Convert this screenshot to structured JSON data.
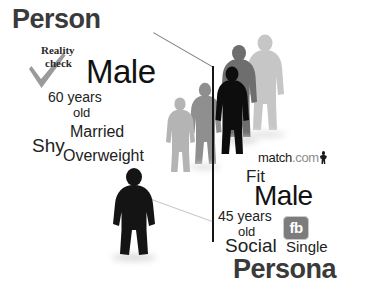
{
  "image": {
    "width": 368,
    "height": 296,
    "background": "#ffffff",
    "kind": "concept-diagram",
    "theme": "person-versus-online-dating-persona"
  },
  "headings": {
    "left": "Person",
    "right": "Persona"
  },
  "person_cloud": {
    "reality_line1": "Reality",
    "reality_line2": "check",
    "primary": "Male",
    "age_line1": "60 years",
    "age_line2": "old",
    "married": "Married",
    "shy": "Shy",
    "overweight": "Overweight"
  },
  "persona_cloud": {
    "brand_primary": "match",
    "brand_suffix": ".com",
    "fit": "Fit",
    "primary": "Male",
    "age_line1": "45 years",
    "age_line2": "old",
    "fb_badge": "fb",
    "social": "Social",
    "single": "Single"
  },
  "icons": {
    "checkmark": "grey-checkmark",
    "match_person": "match-com-person-glyph",
    "facebook": "facebook-fb-badge"
  },
  "colors": {
    "heading": "#3a3a3a",
    "body_text": "#1b1b1b",
    "match_dark": "#1a1a1a",
    "match_grey": "#8d8d8d",
    "fb_badge_bg": "#7c7c7c",
    "fb_badge_text": "#ffffff",
    "checkmark": "#9a9a9a",
    "divider_line": "#151515",
    "figure_darkest": "#0d0d0d",
    "figure_dark": "#111111",
    "figure_mid": "#6e6e6e",
    "figure_light": "#9a9a9a",
    "figure_lightest": "#c6c6c6"
  },
  "figures": [
    {
      "name": "figure-foreground-person",
      "tone": "#141414",
      "role": "person-foreground"
    },
    {
      "name": "figure-queue-1-faint",
      "tone": "#b4b4b4",
      "role": "queue-back"
    },
    {
      "name": "figure-queue-2-mid",
      "tone": "#8f8f8f",
      "role": "queue-back"
    },
    {
      "name": "figure-queue-3-dark",
      "tone": "#0d0d0d",
      "role": "queue-front"
    },
    {
      "name": "figure-queue-4-grey",
      "tone": "#6e6e6e",
      "role": "queue-mid"
    },
    {
      "name": "figure-queue-5-light",
      "tone": "#c6c6c6",
      "role": "queue-far"
    }
  ]
}
